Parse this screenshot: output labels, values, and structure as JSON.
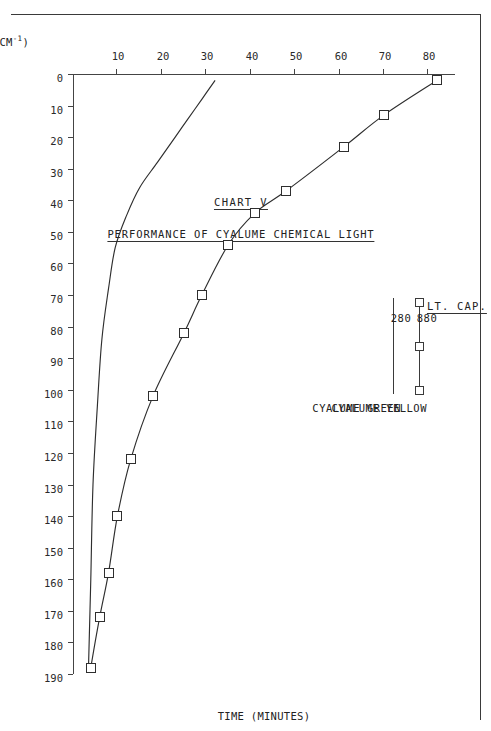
{
  "scan_header": "TECHNICAL REPORT",
  "figure": {
    "chart_number": "CHART V",
    "title": "PERFORMANCE OF CYALUME CHEMICAL LIGHT"
  },
  "axes": {
    "x": {
      "label": "TIME (MINUTES)",
      "ticks": [
        0,
        10,
        20,
        30,
        40,
        50,
        60,
        70,
        80,
        90,
        100,
        110,
        120,
        130,
        140,
        150,
        160,
        170,
        180,
        190
      ],
      "min": 0,
      "max": 190
    },
    "y": {
      "label": "BRIGHTNESS (FT. LMBT. CM",
      "label_sup": "-1",
      "label_tail": ")",
      "ticks": [
        10,
        20,
        30,
        40,
        50,
        60,
        70,
        80
      ],
      "min": 0,
      "max": 86
    }
  },
  "legend": {
    "capacity_header": "LT. CAP.",
    "entries": [
      {
        "name": "CYALUME YELLOW",
        "capacity": "880",
        "marker": "square"
      },
      {
        "name": "CYALUME GREEN",
        "capacity": "280",
        "marker": "none"
      }
    ]
  },
  "chart_data": {
    "type": "line",
    "title": "PERFORMANCE OF CYALUME CHEMICAL LIGHT",
    "subtitle": "CHART V",
    "xlabel": "TIME (MINUTES)",
    "ylabel": "BRIGHTNESS (FT. LMBT. CM-1)",
    "xlim": [
      0,
      190
    ],
    "ylim": [
      0,
      86
    ],
    "grid": false,
    "legend_position": "upper-right",
    "series": [
      {
        "name": "CYALUME YELLOW",
        "light_capacity": 880,
        "marker": "open-square",
        "points": [
          {
            "x": 2,
            "y": 82
          },
          {
            "x": 13,
            "y": 70
          },
          {
            "x": 23,
            "y": 61
          },
          {
            "x": 37,
            "y": 48
          },
          {
            "x": 44,
            "y": 41
          },
          {
            "x": 54,
            "y": 35
          },
          {
            "x": 70,
            "y": 29
          },
          {
            "x": 82,
            "y": 25
          },
          {
            "x": 102,
            "y": 18
          },
          {
            "x": 122,
            "y": 13
          },
          {
            "x": 140,
            "y": 10
          },
          {
            "x": 158,
            "y": 8
          },
          {
            "x": 172,
            "y": 6
          },
          {
            "x": 188,
            "y": 4
          }
        ]
      },
      {
        "name": "CYALUME GREEN",
        "light_capacity": 280,
        "marker": "none",
        "points": [
          {
            "x": 2,
            "y": 32
          },
          {
            "x": 8,
            "y": 29
          },
          {
            "x": 14,
            "y": 26
          },
          {
            "x": 20,
            "y": 23
          },
          {
            "x": 28,
            "y": 19
          },
          {
            "x": 36,
            "y": 15
          },
          {
            "x": 45,
            "y": 12
          },
          {
            "x": 55,
            "y": 9.5
          },
          {
            "x": 68,
            "y": 8
          },
          {
            "x": 84,
            "y": 6.5
          },
          {
            "x": 105,
            "y": 5.5
          },
          {
            "x": 130,
            "y": 4.5
          },
          {
            "x": 160,
            "y": 4
          },
          {
            "x": 188,
            "y": 3.5
          }
        ]
      }
    ]
  }
}
